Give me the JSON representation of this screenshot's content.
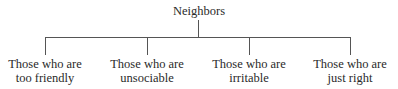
{
  "diagram": {
    "type": "tree",
    "root": {
      "label": "Neighbors"
    },
    "children": [
      {
        "line1": "Those who are",
        "line2": "too friendly"
      },
      {
        "line1": "Those who are",
        "line2": "unsociable"
      },
      {
        "line1": "Those who are",
        "line2": "irritable"
      },
      {
        "line1": "Those who are",
        "line2": "just right"
      }
    ]
  }
}
